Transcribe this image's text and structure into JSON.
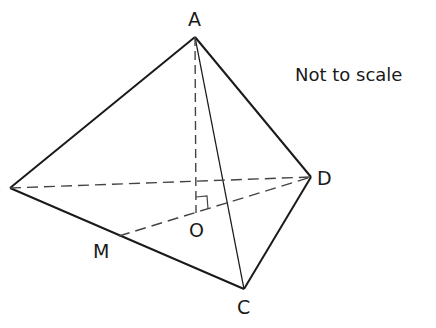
{
  "figure": {
    "type": "tetrahedron-pyramid",
    "note": "Not to scale",
    "labels": {
      "A": "A",
      "B": "B",
      "C": "C",
      "D": "D",
      "M": "M",
      "O": "O"
    },
    "vertices": {
      "A": [
        195,
        37
      ],
      "B": [
        10,
        188
      ],
      "C": [
        244,
        289
      ],
      "D": [
        311,
        177
      ],
      "M": [
        119,
        236
      ],
      "O": [
        196,
        213
      ]
    },
    "solid_edges": [
      "AB",
      "AD",
      "AC",
      "BC",
      "CD"
    ],
    "dashed_edges": [
      "AO",
      "BD",
      "MD"
    ],
    "right_angle_at": "O",
    "colors": {
      "line": "#1a1a1a",
      "dashed": "#444444",
      "background": "#ffffff"
    }
  }
}
